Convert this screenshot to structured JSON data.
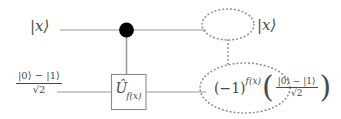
{
  "diagram": {
    "type": "quantum-circuit",
    "background_color": "#ffffff",
    "wire_color": "#9a9a9a",
    "ink_color": "#4a4a4a",
    "dot_color": "#000000",
    "dotted_color": "#8c8c8c"
  },
  "wires": {
    "top": {
      "label_in": "|x⟩",
      "label_out": "|x⟩",
      "y": 30
    },
    "bottom": {
      "label_in_numerator": "|0⟩ − |1⟩",
      "label_in_denominator": "√2",
      "y": 92
    }
  },
  "gate": {
    "name": "U-hat",
    "symbol": "Û",
    "subscript": "f(x)",
    "full_label": "Û_f(x)",
    "controlled": true
  },
  "control": {
    "name": "control-dot",
    "filled": true
  },
  "output_bottom": {
    "base": "(−1)",
    "exponent": "f(x)",
    "paren_open": "(",
    "numerator": "|0⟩ − |1⟩",
    "denominator": "√2",
    "paren_close": ")"
  },
  "annotations": {
    "top_ellipse": "dotted-ellipse-top",
    "bottom_ellipse": "dotted-ellipse-bottom",
    "connector": "dotted-vertical-connector"
  }
}
